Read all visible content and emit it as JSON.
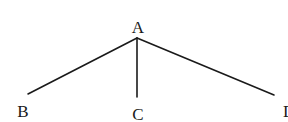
{
  "diagram": {
    "type": "tree",
    "root": {
      "label": "A",
      "children": [
        {
          "label": "B"
        },
        {
          "label": "C"
        },
        {
          "label": "D"
        }
      ]
    },
    "nodes": {
      "a": {
        "label": "A"
      },
      "b": {
        "label": "B"
      },
      "c": {
        "label": "C"
      },
      "d": {
        "label": "D"
      }
    },
    "edges": [
      {
        "from": "A",
        "to": "B"
      },
      {
        "from": "A",
        "to": "C"
      },
      {
        "from": "A",
        "to": "D"
      }
    ],
    "colors": {
      "line": "#1a1a1a",
      "text": "#1a1a1a",
      "background": "#ffffff"
    }
  }
}
